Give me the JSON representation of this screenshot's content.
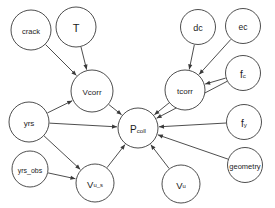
{
  "diagram": {
    "type": "directed-acyclic-graph",
    "title": "",
    "background_color": "#ffffff",
    "node_fill_color": "#ffffff",
    "node_stroke_color": "#3a3a3a",
    "edge_color": "#3a3a3a",
    "label_color": "#1c1c1c",
    "node_count": 14,
    "edge_count": 16,
    "nodes": [
      {
        "id": "crack",
        "label": "crack",
        "sub": "",
        "cx": 31,
        "cy": 30,
        "r": 20,
        "font_size": 7.5
      },
      {
        "id": "T",
        "label": "T",
        "sub": "",
        "cx": 76,
        "cy": 27,
        "r": 20,
        "font_size": 11
      },
      {
        "id": "dc",
        "label": "dc",
        "sub": "",
        "cx": 198,
        "cy": 27,
        "r": 17.5,
        "font_size": 9
      },
      {
        "id": "ec",
        "label": "ec",
        "sub": "",
        "cx": 243,
        "cy": 26,
        "r": 17.5,
        "font_size": 8.5
      },
      {
        "id": "fc",
        "label": "f",
        "sub": "c",
        "cx": 243,
        "cy": 73,
        "r": 17.5,
        "font_size": 10
      },
      {
        "id": "Vcorr",
        "label": "Vcorr",
        "sub": "",
        "cx": 92,
        "cy": 91,
        "r": 21,
        "font_size": 8
      },
      {
        "id": "tcorr",
        "label": "tcorr",
        "sub": "",
        "cx": 185,
        "cy": 90,
        "r": 20,
        "font_size": 8
      },
      {
        "id": "yrs",
        "label": "yrs",
        "sub": "",
        "cx": 29,
        "cy": 122,
        "r": 20,
        "font_size": 8
      },
      {
        "id": "fy",
        "label": "f",
        "sub": "y",
        "cx": 244,
        "cy": 122,
        "r": 17.5,
        "font_size": 10
      },
      {
        "id": "Pcoll",
        "label": "P",
        "sub": "coll",
        "cx": 138,
        "cy": 128,
        "r": 20,
        "font_size": 10
      },
      {
        "id": "geometry",
        "label": "geometry",
        "sub": "",
        "cx": 245,
        "cy": 165,
        "r": 17.5,
        "font_size": 7.5
      },
      {
        "id": "yrs_obs",
        "label": "yrs_obs",
        "sub": "",
        "cx": 30,
        "cy": 169,
        "r": 18,
        "font_size": 7
      },
      {
        "id": "V_u_s",
        "label": "V",
        "sub": "u_s",
        "cx": 95,
        "cy": 183,
        "r": 19,
        "font_size": 9.5
      },
      {
        "id": "V_u",
        "label": "V",
        "sub": "u",
        "cx": 181,
        "cy": 184,
        "r": 19,
        "font_size": 9.5
      }
    ],
    "edges": [
      {
        "from": "crack",
        "to": "Vcorr"
      },
      {
        "from": "T",
        "to": "Vcorr"
      },
      {
        "from": "yrs",
        "to": "Vcorr"
      },
      {
        "from": "dc",
        "to": "tcorr"
      },
      {
        "from": "ec",
        "to": "tcorr"
      },
      {
        "from": "fc",
        "to": "tcorr"
      },
      {
        "from": "Vcorr",
        "to": "Pcoll"
      },
      {
        "from": "tcorr",
        "to": "Pcoll"
      },
      {
        "from": "yrs",
        "to": "Pcoll"
      },
      {
        "from": "fc",
        "to": "Pcoll"
      },
      {
        "from": "fy",
        "to": "Pcoll"
      },
      {
        "from": "geometry",
        "to": "Pcoll"
      },
      {
        "from": "V_u_s",
        "to": "Pcoll"
      },
      {
        "from": "V_u",
        "to": "Pcoll"
      },
      {
        "from": "yrs",
        "to": "V_u_s"
      },
      {
        "from": "yrs_obs",
        "to": "V_u_s"
      }
    ]
  }
}
